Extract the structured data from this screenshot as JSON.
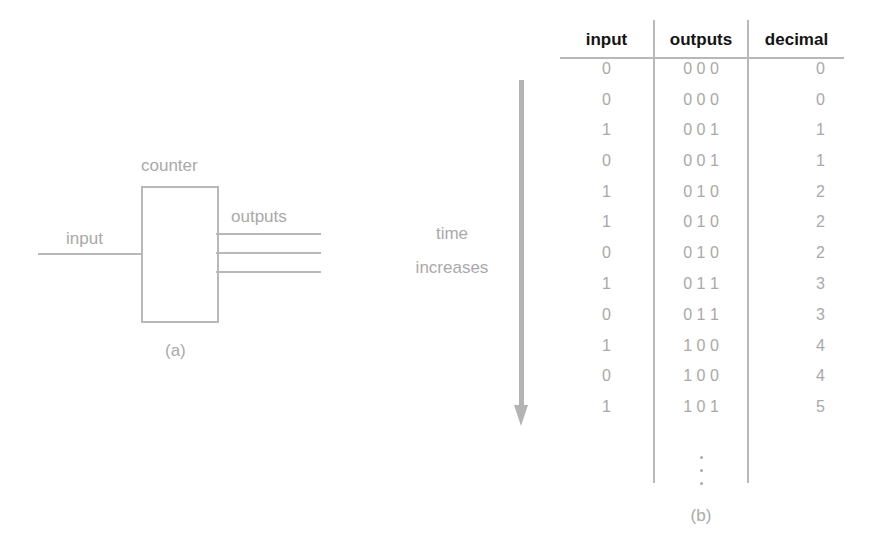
{
  "panel_a": {
    "caption": "(a)",
    "block_label": "counter",
    "input_label": "input",
    "outputs_label": "outputs",
    "output_line_count": 3
  },
  "panel_b": {
    "caption": "(b)",
    "time_label_line1": "time",
    "time_label_line2": "increases",
    "columns": [
      "input",
      "outputs",
      "decimal"
    ],
    "rows": [
      {
        "input": "0",
        "outputs": "0 0 0",
        "decimal": "0"
      },
      {
        "input": "0",
        "outputs": "0 0 0",
        "decimal": "0"
      },
      {
        "input": "1",
        "outputs": "0 0 1",
        "decimal": "1"
      },
      {
        "input": "0",
        "outputs": "0 0 1",
        "decimal": "1"
      },
      {
        "input": "1",
        "outputs": "0 1 0",
        "decimal": "2"
      },
      {
        "input": "1",
        "outputs": "0 1 0",
        "decimal": "2"
      },
      {
        "input": "0",
        "outputs": "0 1 0",
        "decimal": "2"
      },
      {
        "input": "1",
        "outputs": "0 1 1",
        "decimal": "3"
      },
      {
        "input": "0",
        "outputs": "0 1 1",
        "decimal": "3"
      },
      {
        "input": "1",
        "outputs": "1 0 0",
        "decimal": "4"
      },
      {
        "input": "0",
        "outputs": "1 0 0",
        "decimal": "4"
      },
      {
        "input": "1",
        "outputs": "1 0 1",
        "decimal": "5"
      }
    ],
    "continuation": "⋮"
  },
  "colors": {
    "line": "#b8b8b8",
    "text_gray": "#a9a9a9",
    "header_text": "#151515"
  }
}
